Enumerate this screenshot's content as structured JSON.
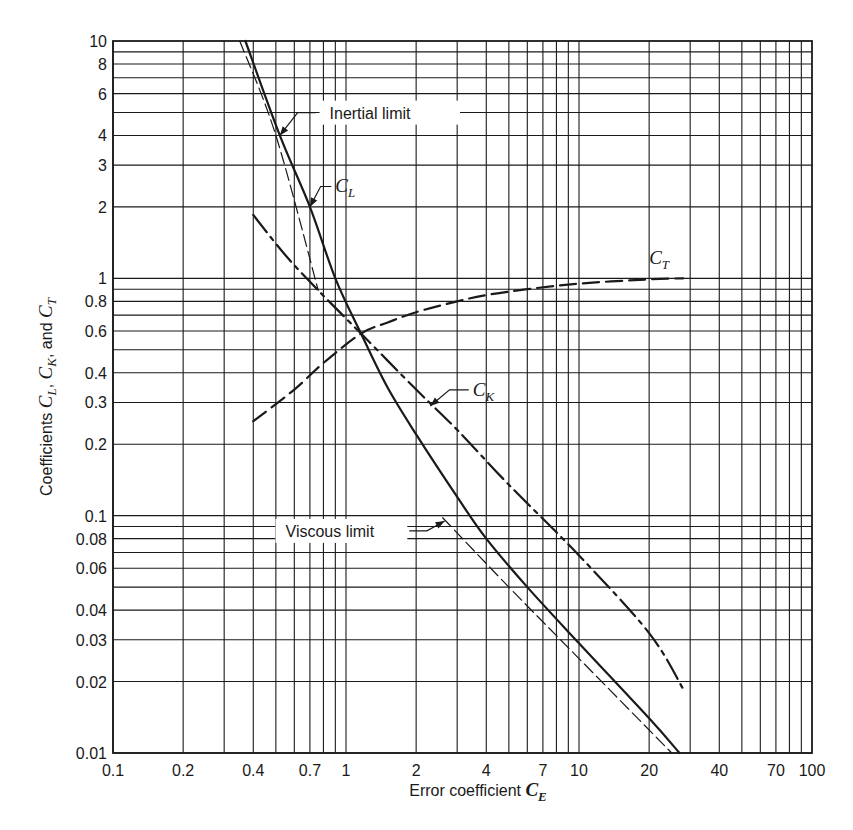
{
  "chart_data": {
    "type": "line",
    "title": "",
    "xlabel": "Error coefficient C_E",
    "xlabel_parts": {
      "text": "Error coefficient ",
      "symbol": "C",
      "sub": "E"
    },
    "ylabel": "Coefficients C_L, C_K, and C_T",
    "ylabel_parts": {
      "prefix": "Coefficients ",
      "c1": "C",
      "s1": "L",
      "sep1": ", ",
      "c2": "C",
      "s2": "K",
      "sep2": ", and ",
      "c3": "C",
      "s3": "T"
    },
    "xscale": "log",
    "yscale": "log",
    "xlim": [
      0.1,
      100
    ],
    "ylim": [
      0.01,
      10
    ],
    "grid": true,
    "x_ticks": [
      0.1,
      0.2,
      0.4,
      0.7,
      1,
      2,
      4,
      7,
      10,
      20,
      40,
      70,
      100
    ],
    "x_tick_labels": [
      "0.1",
      "0.2",
      "0.4",
      "0.7",
      "1",
      "2",
      "4",
      "7",
      "10",
      "20",
      "40",
      "70",
      "100"
    ],
    "y_ticks": [
      0.01,
      0.02,
      0.03,
      0.04,
      0.06,
      0.08,
      0.1,
      0.2,
      0.3,
      0.4,
      0.6,
      0.8,
      1,
      2,
      3,
      4,
      6,
      8,
      10
    ],
    "y_tick_labels": [
      "0.01",
      "0.02",
      "0.03",
      "0.04",
      "0.06",
      "0.08",
      "0.1",
      "0.2",
      "0.3",
      "0.4",
      "0.6",
      "0.8",
      "1",
      "2",
      "3",
      "4",
      "6",
      "8",
      "10"
    ],
    "series": [
      {
        "name": "C_L",
        "style": "solid",
        "width": 2.2,
        "x": [
          0.37,
          0.52,
          0.7,
          0.9,
          1.16,
          1.5,
          2.0,
          3.0,
          4.0,
          6.0,
          10.0,
          20.0,
          27.0
        ],
        "y": [
          10.0,
          4.0,
          2.0,
          1.0,
          0.585,
          0.35,
          0.22,
          0.12,
          0.08,
          0.05,
          0.029,
          0.014,
          0.01
        ]
      },
      {
        "name": "C_K",
        "style": "dashdot",
        "width": 2.2,
        "x": [
          0.4,
          0.55,
          0.76,
          1.16,
          2.0,
          3.0,
          5.0,
          10.0,
          20.0,
          28.0
        ],
        "y": [
          1.85,
          1.25,
          0.89,
          0.585,
          0.34,
          0.23,
          0.135,
          0.068,
          0.032,
          0.0186
        ]
      },
      {
        "name": "C_T",
        "style": "dashed",
        "width": 2.2,
        "x": [
          0.4,
          0.6,
          0.8,
          1.16,
          1.5,
          2.0,
          3.0,
          4.0,
          6.0,
          10.0,
          20.0,
          28.0
        ],
        "y": [
          0.25,
          0.34,
          0.44,
          0.585,
          0.65,
          0.72,
          0.8,
          0.85,
          0.9,
          0.95,
          0.99,
          1.0
        ]
      },
      {
        "name": "Inertial limit",
        "style": "thindash",
        "width": 1.2,
        "x": [
          0.35,
          0.5,
          0.76
        ],
        "y": [
          10.0,
          4.0,
          0.89
        ]
      },
      {
        "name": "Viscous limit",
        "style": "thindash",
        "width": 1.2,
        "x": [
          2.6,
          5.0,
          10.0,
          25.0
        ],
        "y": [
          0.098,
          0.05,
          0.025,
          0.01
        ]
      }
    ],
    "annotations": [
      {
        "text": "Inertial limit",
        "x": 0.85,
        "y": 4.8,
        "arrow_to": [
          0.52,
          4.0
        ]
      },
      {
        "symbol": "C",
        "sub": "L",
        "x": 0.9,
        "y": 2.3,
        "arrow_to": [
          0.7,
          2.0
        ]
      },
      {
        "symbol": "C",
        "sub": "T",
        "x": 20.0,
        "y": 1.15
      },
      {
        "symbol": "C",
        "sub": "K",
        "x": 3.5,
        "y": 0.32,
        "arrow_to": [
          2.3,
          0.29
        ]
      },
      {
        "text": "Viscous limit",
        "x": 0.55,
        "y": 0.083,
        "arrow_to": [
          2.65,
          0.095
        ]
      }
    ]
  },
  "colors": {
    "ink": "#1a1a1a",
    "background": "#ffffff"
  }
}
